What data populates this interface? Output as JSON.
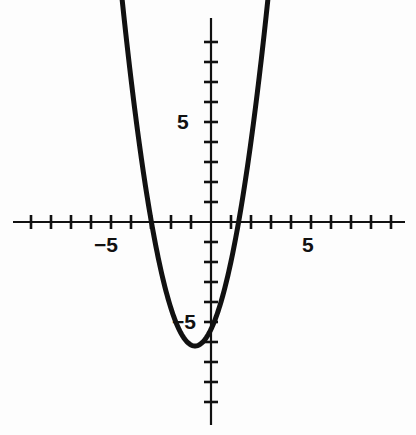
{
  "figure": {
    "name": "parabola-coordinate-graph",
    "background_color": "#fdfdfd",
    "ink_color": "#111111"
  },
  "axes": {
    "origin_px": {
      "x": 211,
      "y": 222
    },
    "pixels_per_unit": 20,
    "x_axis": {
      "name": "x-axis",
      "start_px": 13,
      "end_px": 405,
      "tick_length_px": 14,
      "ticks": [
        -9,
        -8,
        -7,
        -6,
        -5,
        -4,
        -3,
        -2,
        -1,
        1,
        2,
        3,
        4,
        5,
        6,
        7,
        8,
        9
      ],
      "labels": [
        {
          "value": -5,
          "text": "−5"
        },
        {
          "value": 5,
          "text": "5"
        }
      ]
    },
    "y_axis": {
      "name": "y-axis",
      "start_px": 18,
      "end_px": 425,
      "tick_length_px": 14,
      "ticks": [
        -9,
        -8,
        -7,
        -6,
        -5,
        -4,
        -3,
        -2,
        -1,
        1,
        2,
        3,
        4,
        5,
        6,
        7,
        8,
        9
      ],
      "labels": [
        {
          "value": 5,
          "text": "5"
        },
        {
          "value": -5,
          "text": "−5"
        }
      ]
    }
  },
  "chart_data": {
    "type": "line",
    "title": "",
    "xlabel": "",
    "ylabel": "",
    "xlim": [
      -9.9,
      9.7
    ],
    "ylim": [
      -10.2,
      10.2
    ],
    "grid": false,
    "legend": null,
    "curve_style": {
      "color": "#111111",
      "width_px": 5,
      "cap": "round"
    },
    "series": [
      {
        "name": "parabola",
        "equation": "y = 1.3(x + 0.8)^2 - 6.2",
        "vertex": [
          -0.8,
          -6.2
        ],
        "roots": [
          -2.98,
          1.38
        ],
        "x_domain": [
          -4.75,
          3.1
        ],
        "x": [
          -4.75,
          -4.5,
          -4.25,
          -4.0,
          -3.75,
          -3.5,
          -3.25,
          -3.0,
          -2.75,
          -2.5,
          -2.25,
          -2.0,
          -1.75,
          -1.5,
          -1.25,
          -1.0,
          -0.8,
          -0.5,
          -0.25,
          0.0,
          0.25,
          0.5,
          0.75,
          1.0,
          1.25,
          1.5,
          1.75,
          2.0,
          2.25,
          2.5,
          2.75,
          3.0,
          3.1
        ],
        "y": [
          9.85,
          8.23,
          6.69,
          0.719,
          0,
          0,
          0,
          0,
          0,
          0,
          0,
          0,
          0,
          0,
          0,
          0,
          -6.2,
          -6.08,
          -5.72,
          -5.37,
          -4.83,
          -4.0,
          -3.16,
          -2.0,
          -0.92,
          0.5,
          2.08,
          3.93,
          5.8,
          8.04,
          10.3,
          12.5,
          13.6
        ]
      }
    ]
  },
  "curve_path": "M 116 22 C 128 62 146 132 166 218 C 178 268 188 322 195 343 C 201 350 208 350 214 340 C 224 318 238 262 252 206 C 266 150 278 70 283 22"
}
